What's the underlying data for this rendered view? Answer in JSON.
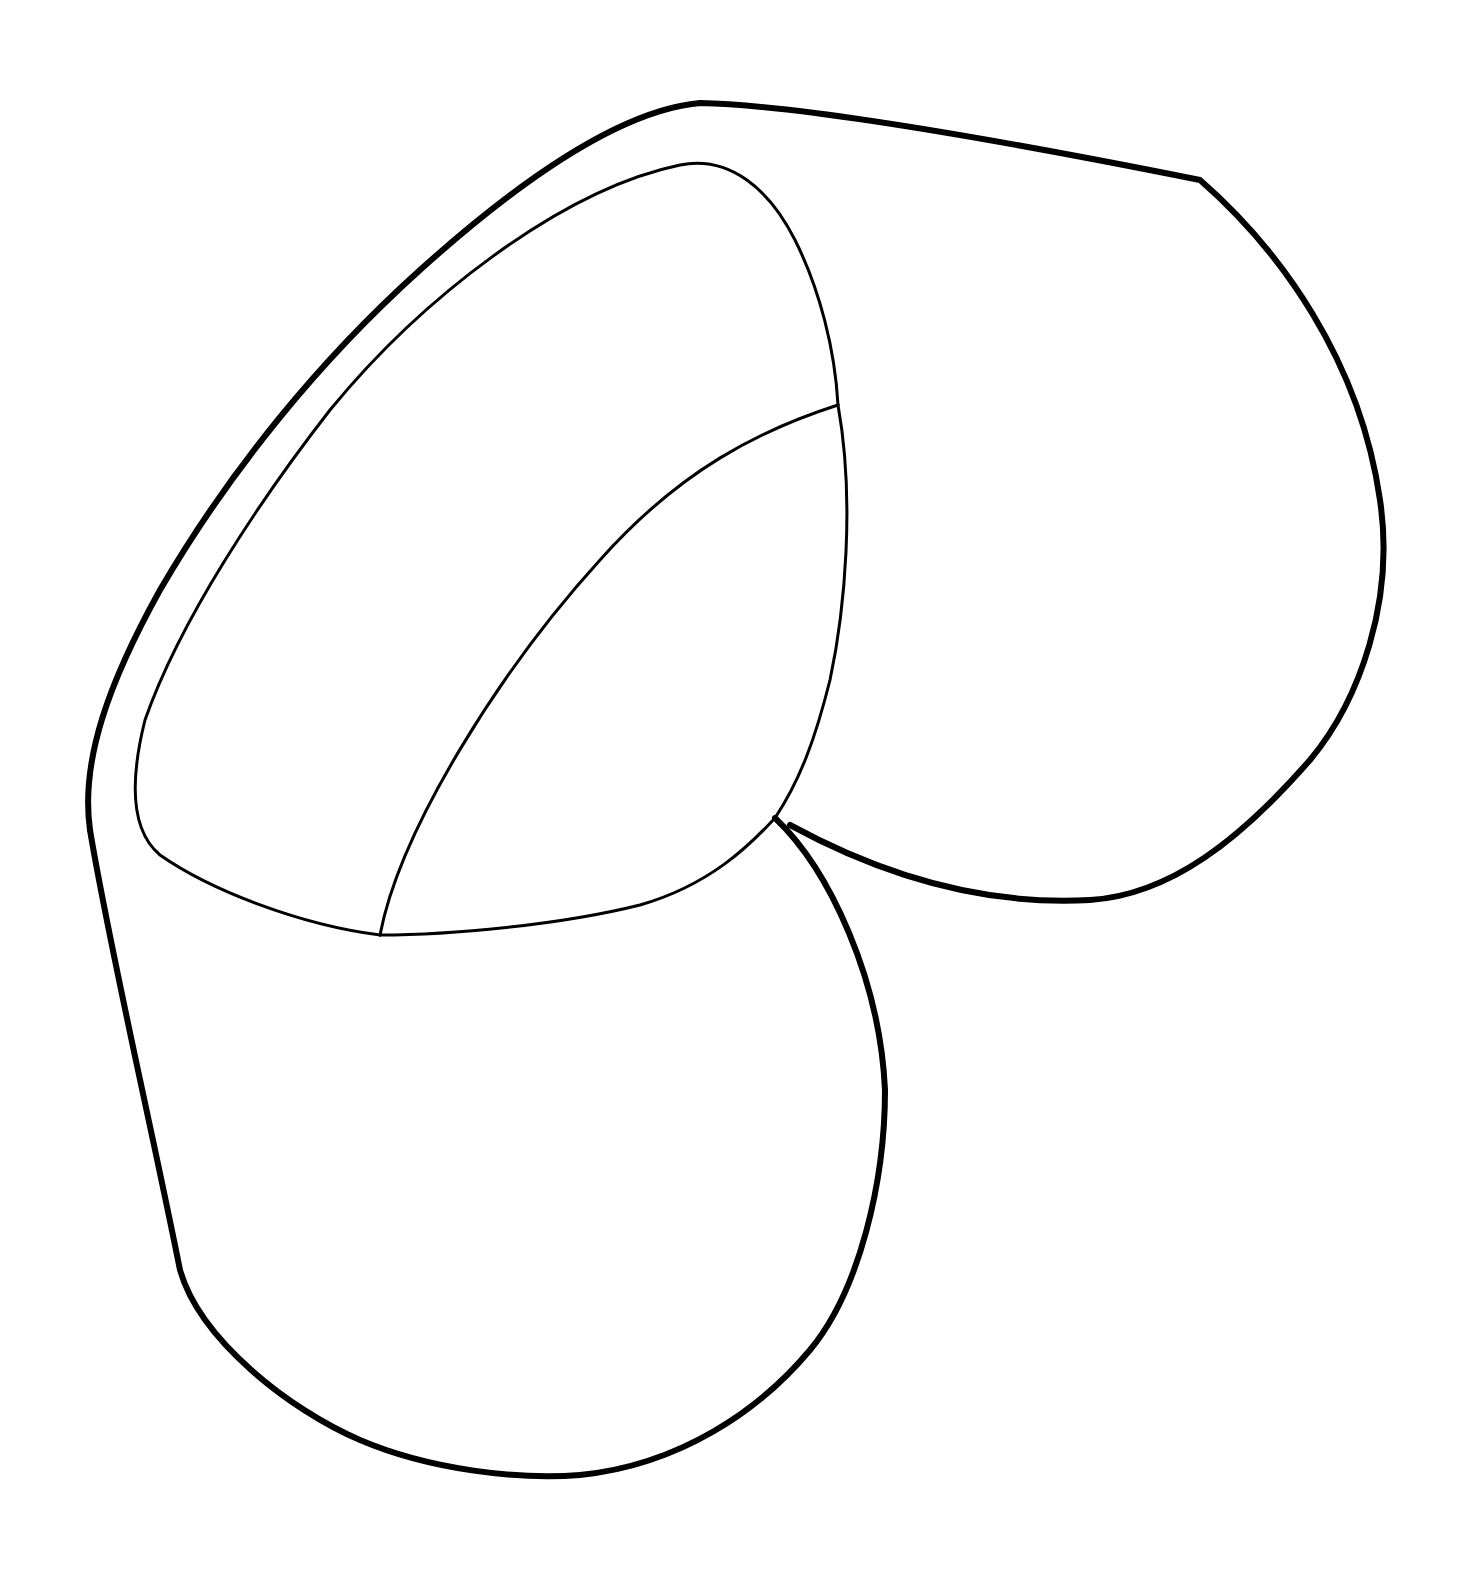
{
  "drawing": {
    "subject": "line-art outline of a bent pipe elbow / folded shape",
    "stroke_color": "#000000",
    "background_color": "#ffffff",
    "caption": ""
  }
}
